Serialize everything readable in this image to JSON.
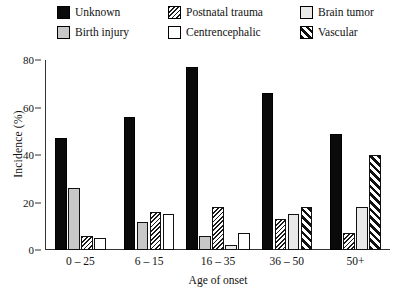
{
  "legend": {
    "items": [
      {
        "label": "Unknown",
        "swatch": "solid-black",
        "key": "unknown"
      },
      {
        "label": "Postnatal trauma",
        "swatch": "dense-hatch",
        "key": "postnatal"
      },
      {
        "label": "Brain tumor",
        "swatch": "dotted-light",
        "key": "tumor"
      },
      {
        "label": "Birth injury",
        "swatch": "solid-gray",
        "key": "birth"
      },
      {
        "label": "Centrencephalic",
        "swatch": "solid-white",
        "key": "centre"
      },
      {
        "label": "Vascular",
        "swatch": "wide-diagonal",
        "key": "vascular"
      }
    ]
  },
  "chart_data": {
    "type": "bar",
    "title": "",
    "xlabel": "Age of onset",
    "ylabel": "Incidence (%)",
    "categories": [
      "0 – 25",
      "6 – 15",
      "16 – 35",
      "36 – 50",
      "50+"
    ],
    "ylim": [
      0,
      80
    ],
    "yticks": [
      0,
      20,
      40,
      60,
      80
    ],
    "grid": false,
    "legend_position": "top",
    "series": [
      {
        "name": "Unknown",
        "values": [
          47,
          56,
          77,
          66,
          49
        ]
      },
      {
        "name": "Birth injury",
        "values": [
          26,
          12,
          6,
          null,
          null
        ]
      },
      {
        "name": "Postnatal trauma",
        "values": [
          6,
          16,
          18,
          13,
          7
        ]
      },
      {
        "name": "Brain tumor",
        "values": [
          null,
          null,
          2,
          15,
          18
        ]
      },
      {
        "name": "Centrencephalic",
        "values": [
          5,
          15,
          7,
          null,
          null
        ]
      },
      {
        "name": "Vascular",
        "values": [
          null,
          null,
          null,
          18,
          40
        ]
      }
    ],
    "group_bars": [
      [
        {
          "key": "unknown",
          "value": 47
        },
        {
          "key": "birth",
          "value": 26
        },
        {
          "key": "postnatal",
          "value": 6
        },
        {
          "key": "centre",
          "value": 5
        }
      ],
      [
        {
          "key": "unknown",
          "value": 56
        },
        {
          "key": "birth",
          "value": 12
        },
        {
          "key": "postnatal",
          "value": 16
        },
        {
          "key": "centre",
          "value": 15
        }
      ],
      [
        {
          "key": "unknown",
          "value": 77
        },
        {
          "key": "birth",
          "value": 6
        },
        {
          "key": "postnatal",
          "value": 18
        },
        {
          "key": "tumor",
          "value": 2
        },
        {
          "key": "centre",
          "value": 7
        }
      ],
      [
        {
          "key": "unknown",
          "value": 66
        },
        {
          "key": "postnatal",
          "value": 13
        },
        {
          "key": "tumor",
          "value": 15
        },
        {
          "key": "vascular",
          "value": 18
        }
      ],
      [
        {
          "key": "unknown",
          "value": 49
        },
        {
          "key": "postnatal",
          "value": 7
        },
        {
          "key": "tumor",
          "value": 18
        },
        {
          "key": "vascular",
          "value": 40
        }
      ]
    ]
  }
}
